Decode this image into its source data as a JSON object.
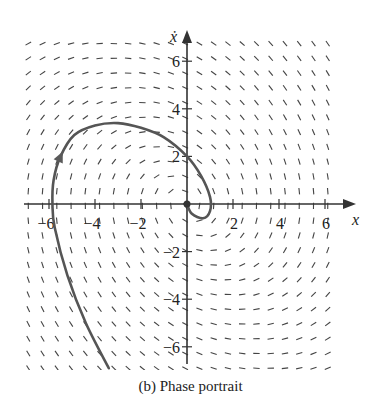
{
  "caption": "(b)  Phase portrait",
  "chart_data": {
    "type": "line",
    "title": "Phase portrait",
    "subtitle": "(b)",
    "xlabel": "x",
    "ylabel": "ẋ",
    "xlim": [
      -7,
      7
    ],
    "ylim": [
      -7,
      7
    ],
    "x_ticks": [
      -6,
      -4,
      -2,
      2,
      4,
      6
    ],
    "y_ticks": [
      -6,
      -4,
      -2,
      2,
      4,
      6
    ],
    "x_tick_labels": [
      "−6",
      "−4",
      "−2",
      "2",
      "4",
      "6"
    ],
    "y_tick_labels": [
      "−6",
      "−4",
      "−2",
      "2",
      "4",
      "6"
    ],
    "grid": false,
    "direction_field": {
      "system": "x' = ẋ, ẋ' = -x - 0.5ẋ",
      "x_range": [
        -6.9,
        6.7
      ],
      "y_range": [
        -6.9,
        7.1
      ],
      "spacing": 0.62
    },
    "series": [
      {
        "name": "trajectory",
        "points": [
          [
            -3.4,
            -6.9
          ],
          [
            -4.4,
            -5.0
          ],
          [
            -5.2,
            -3.0
          ],
          [
            -5.75,
            -1.0
          ],
          [
            -5.85,
            0.0
          ],
          [
            -5.8,
            1.0
          ],
          [
            -5.5,
            2.0
          ],
          [
            -4.9,
            2.9
          ],
          [
            -4.0,
            3.3
          ],
          [
            -3.0,
            3.4
          ],
          [
            -2.0,
            3.2
          ],
          [
            -1.0,
            2.8
          ],
          [
            0.0,
            2.0
          ],
          [
            0.6,
            1.2
          ],
          [
            1.0,
            0.3
          ],
          [
            1.0,
            -0.3
          ],
          [
            0.7,
            -0.6
          ],
          [
            0.2,
            -0.4
          ],
          [
            0.0,
            0.0
          ]
        ],
        "arrow_at": [
          -5.5,
          2.0
        ],
        "color": "#555555"
      }
    ],
    "colors": {
      "axis": "#333333",
      "field": "#444444",
      "curve": "#5a5a5a"
    }
  }
}
